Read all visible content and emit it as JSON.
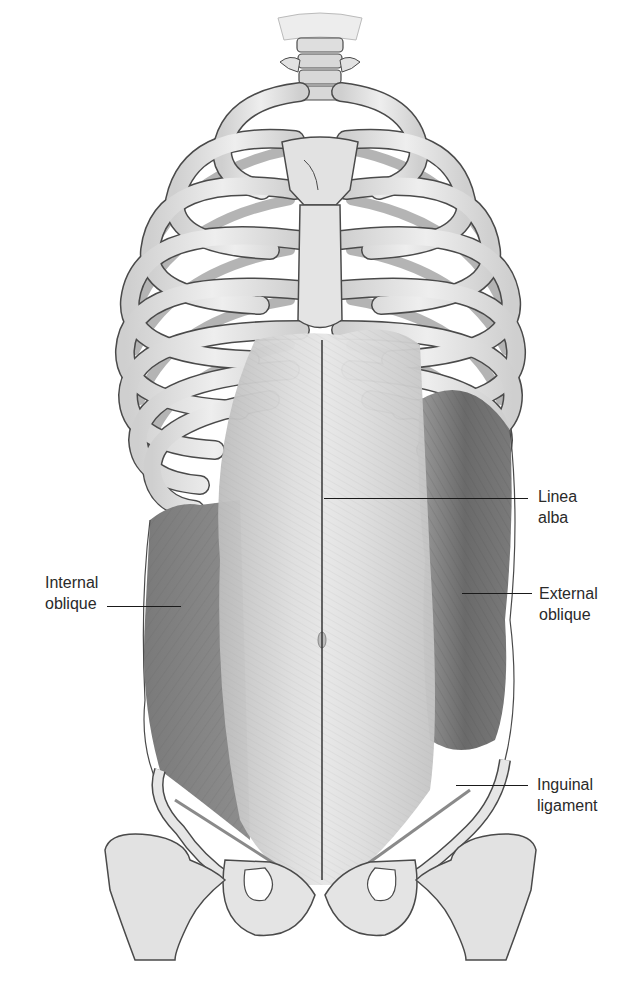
{
  "figure": {
    "colors": {
      "background": "#ffffff",
      "bone": "#e4e4e4",
      "bone_shade": "#bdbdbd",
      "cartilage": "#c9c9c9",
      "outline": "#4a4a4a",
      "rectus": "#d6d6d6",
      "oblique_dark": "#6e6e6e",
      "oblique_mid": "#8f8f8f",
      "leader_line": "#1a1a1a",
      "label_text": "#2a2a2a"
    }
  },
  "labels": {
    "linea_alba": {
      "line1": "Linea",
      "line2": "alba"
    },
    "internal_oblique": {
      "line1": "Internal",
      "line2": "oblique"
    },
    "external_oblique": {
      "line1": "External",
      "line2": "oblique"
    },
    "inguinal_ligament": {
      "line1": "Inguinal",
      "line2": "ligament"
    }
  }
}
